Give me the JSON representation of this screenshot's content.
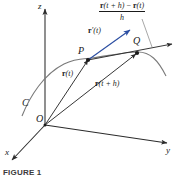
{
  "figure": {
    "caption": "FIGURE 1",
    "background_color": "#ffffff",
    "curve_color": "#6b6b6b",
    "line_color": "#2b2b2b",
    "tangent_color": "#2b4ea2",
    "axes": {
      "x_label": "x",
      "y_label": "y",
      "z_label": "z"
    },
    "points": {
      "origin_label": "O",
      "p_label": "P",
      "q_label": "Q"
    },
    "curve_label": "C",
    "vectors": {
      "position_t": {
        "bold": "r",
        "arg": "(t)"
      },
      "position_t_plus_h": {
        "bold": "r",
        "arg": "(t + h)"
      },
      "derivative": {
        "bold": "r",
        "arg": "′(t)"
      }
    },
    "difference_quotient": {
      "numerator_r1": "r",
      "numerator_arg1": "(t + h)",
      "numerator_minus": " − ",
      "numerator_r2": "r",
      "numerator_arg2": "(t)",
      "denominator": "h"
    }
  }
}
